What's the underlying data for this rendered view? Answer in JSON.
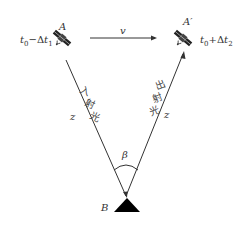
{
  "diagram": {
    "satellite_a": {
      "label": "A",
      "time_label": "t0−Δt1",
      "time_base": "t",
      "time_sub0": "0",
      "time_op": "−Δ",
      "time_var": "t",
      "time_sub1": "1"
    },
    "satellite_a_prime": {
      "label": "A′",
      "time_label": "t0+Δt2",
      "time_base": "t",
      "time_sub0": "0",
      "time_op": "+Δ",
      "time_var": "t",
      "time_sub2": "2"
    },
    "velocity": {
      "label": "v"
    },
    "incident_ray": {
      "label": "入射光",
      "chars": [
        "入",
        "射",
        "光"
      ],
      "distance_label": "z"
    },
    "outgoing_ray": {
      "label": "出射光",
      "chars": [
        "出",
        "射",
        "光"
      ],
      "distance_label": "z"
    },
    "angle": {
      "label": "β"
    },
    "ground_station": {
      "label": "B"
    },
    "colors": {
      "line": "#333333",
      "fill": "#000000"
    }
  }
}
